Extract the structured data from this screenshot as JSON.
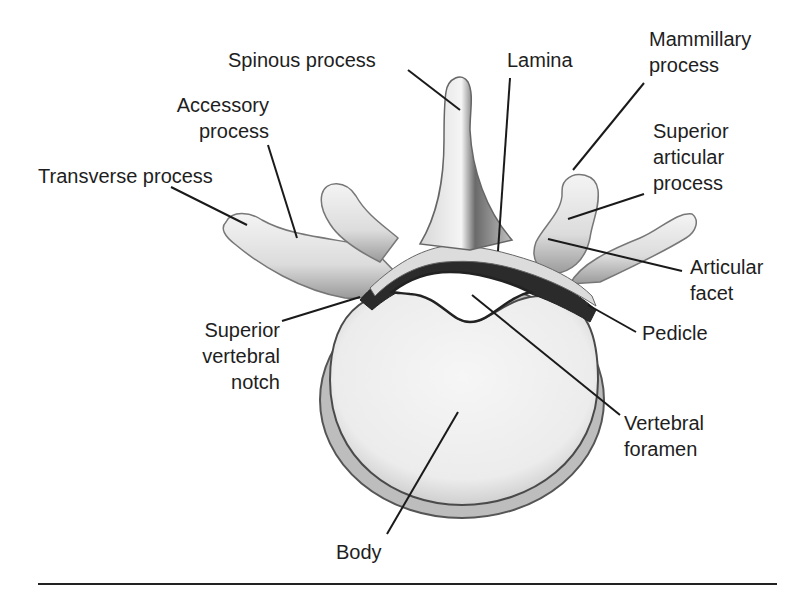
{
  "figure": {
    "labels": {
      "spinous_process": "Spinous process",
      "lamina": "Lamina",
      "mammillary_process": "Mammillary\nprocess",
      "accessory_process": "Accessory\nprocess",
      "transverse_process": "Transverse process",
      "superior_articular_process": "Superior\narticular\nprocess",
      "articular_facet": "Articular\nfacet",
      "superior_vertebral_notch": "Superior\nvertebral\nnotch",
      "pedicle": "Pedicle",
      "vertebral_foramen": "Vertebral\nforamen",
      "body": "Body"
    },
    "colors": {
      "text": "#1e1e1e",
      "leader_line": "#1a1a1a",
      "bone_light": "#f2f2f2",
      "bone_shadow": "#3a3a3a",
      "rule": "#222222"
    }
  }
}
